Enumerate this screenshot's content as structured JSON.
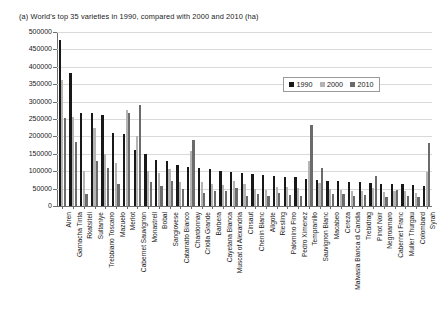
{
  "caption": "(a) World's top 35 varieties in 1990, compared with 2000 and 2010 (ha)",
  "legend": {
    "position": "inside-top-right",
    "entries": [
      {
        "label": "1990",
        "color": "#181818"
      },
      {
        "label": "2000",
        "color": "#b4b4b4"
      },
      {
        "label": "2010",
        "color": "#6b6b6b"
      }
    ]
  },
  "axes": {
    "y_ticks": [
      "0",
      "50000",
      "100000",
      "150000",
      "200000",
      "250000",
      "300000",
      "350000",
      "400000",
      "450000",
      "500000"
    ],
    "ylim": [
      0,
      500000
    ],
    "y_step": 50000,
    "grid": true,
    "xlabel": "",
    "ylabel": ""
  },
  "chart_data": {
    "type": "bar",
    "title": "(a) World's top 35 varieties in 1990, compared with 2000 and 2010 (ha)",
    "xlabel": "",
    "ylabel": "",
    "ylim": [
      0,
      500000
    ],
    "ytick_step": 50000,
    "grid": true,
    "legend_position": "inside-top-right",
    "categories": [
      "Airen",
      "Garnacha Tinta",
      "Rkatsiteli",
      "Sultaniye",
      "Trebbiano Toscano",
      "Mazuelo",
      "Merlot",
      "Cabernet Sauvignon",
      "Monastrell",
      "Bobal",
      "Sangiovese",
      "Catarratto Bianco",
      "Chardonnay",
      "Criolla Grande",
      "Barbera",
      "Cayetana Blanca",
      "Muscat of Alexandria",
      "Cinsaut",
      "Chenin Blanc",
      "Aligote",
      "Riesling",
      "Palomino Fino",
      "Pedro Ximenez",
      "Tempranillo",
      "Sauvignon Blanc",
      "Macabeo",
      "Cereza",
      "Malvasia Bianca di Candia",
      "Trebidrag",
      "Pinot Noir",
      "Negroamaro",
      "Cabernet Franc",
      "Muller Thurgau",
      "Colombard",
      "Syrah"
    ],
    "series": [
      {
        "name": "1990",
        "color": "#181818",
        "values": [
          476000,
          382000,
          268000,
          268000,
          261000,
          210000,
          208000,
          162000,
          150000,
          133000,
          128000,
          118000,
          113000,
          110000,
          106000,
          102000,
          99000,
          95000,
          92000,
          88000,
          86000,
          84000,
          82000,
          79000,
          75000,
          73000,
          71000,
          69000,
          68000,
          66000,
          64000,
          63000,
          62000,
          60000,
          58000
        ]
      },
      {
        "name": "2000",
        "color": "#b4b4b4",
        "values": [
          362000,
          256000,
          102000,
          224000,
          150000,
          123000,
          275000,
          200000,
          100000,
          95000,
          105000,
          70000,
          158000,
          68000,
          62000,
          60000,
          72000,
          62000,
          50000,
          45000,
          54000,
          56000,
          52000,
          130000,
          65000,
          48000,
          46000,
          42000,
          44000,
          53000,
          40000,
          42000,
          42000,
          38000,
          98000
        ]
      },
      {
        "name": "2010",
        "color": "#6b6b6b",
        "values": [
          252000,
          185000,
          34000,
          130000,
          110000,
          62000,
          266000,
          290000,
          68000,
          58000,
          72000,
          48000,
          190000,
          38000,
          44000,
          42000,
          52000,
          30000,
          35000,
          28000,
          36000,
          32000,
          28000,
          232000,
          110000,
          34000,
          34000,
          28000,
          32000,
          86000,
          25000,
          45000,
          28000,
          27000,
          182000
        ]
      }
    ]
  }
}
